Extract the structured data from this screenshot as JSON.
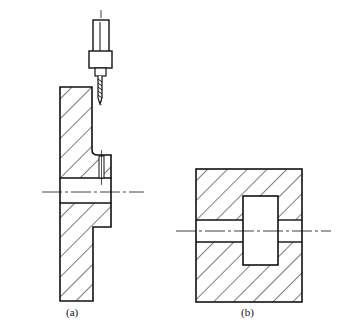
{
  "figure": {
    "labels": {
      "a": "(a)",
      "b": "(b)"
    },
    "colors": {
      "line": "#111111",
      "background": "#ffffff"
    }
  }
}
